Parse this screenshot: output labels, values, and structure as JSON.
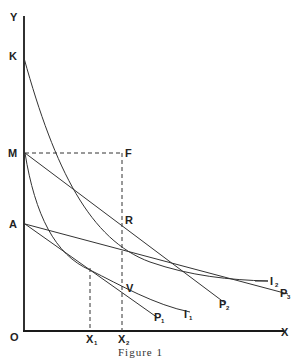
{
  "figure": {
    "caption": "Figure 1",
    "axes": {
      "y_label": "Y",
      "x_label": "X",
      "origin_label": "O"
    },
    "points": {
      "K": "K",
      "M": "M",
      "A": "A",
      "F": "F",
      "R": "R",
      "V": "V"
    },
    "x_ticks": [
      {
        "label": "X",
        "sub": "1"
      },
      {
        "label": "X",
        "sub": "2"
      }
    ],
    "curve_labels": [
      {
        "id": "I1",
        "label": "I",
        "sub": "1"
      },
      {
        "id": "I2",
        "label": "I",
        "sub": "2"
      },
      {
        "id": "P1",
        "label": "P",
        "sub": "1"
      },
      {
        "id": "P2",
        "label": "P",
        "sub": "2"
      },
      {
        "id": "P3",
        "label": "P",
        "sub": "3"
      }
    ]
  }
}
